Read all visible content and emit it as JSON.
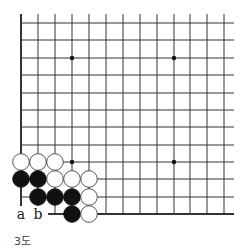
{
  "diagram": {
    "type": "go-board-fragment",
    "caption": "3도",
    "grid": {
      "cols_x": [
        21,
        38,
        55,
        72,
        89,
        106,
        123,
        140,
        157,
        174,
        190,
        207,
        224
      ],
      "rows_y": [
        23,
        40,
        58,
        75,
        93,
        110,
        127,
        145,
        162,
        179,
        197,
        214
      ],
      "line_color": "#333333",
      "edge_left": true,
      "edge_bottom": true
    },
    "star_points": [
      {
        "col": 3,
        "row": 2
      },
      {
        "col": 9,
        "row": 2
      },
      {
        "col": 3,
        "row": 8
      },
      {
        "col": 9,
        "row": 8
      }
    ],
    "stones": [
      {
        "color": "white",
        "col": 0,
        "row": 8
      },
      {
        "color": "white",
        "col": 1,
        "row": 8
      },
      {
        "color": "white",
        "col": 2,
        "row": 8
      },
      {
        "color": "black",
        "col": 0,
        "row": 9
      },
      {
        "color": "black",
        "col": 1,
        "row": 9
      },
      {
        "color": "white",
        "col": 2,
        "row": 9
      },
      {
        "color": "white",
        "col": 3,
        "row": 9
      },
      {
        "color": "white",
        "col": 4,
        "row": 9
      },
      {
        "color": "black",
        "col": 1,
        "row": 10
      },
      {
        "color": "black",
        "col": 2,
        "row": 10
      },
      {
        "color": "black",
        "col": 3,
        "row": 10
      },
      {
        "color": "white",
        "col": 4,
        "row": 10
      },
      {
        "color": "black",
        "col": 3,
        "row": 11
      },
      {
        "color": "white",
        "col": 4,
        "row": 11
      }
    ],
    "labels": [
      {
        "text": "a",
        "col": 0,
        "row": 11
      },
      {
        "text": "b",
        "col": 1,
        "row": 11
      }
    ]
  }
}
